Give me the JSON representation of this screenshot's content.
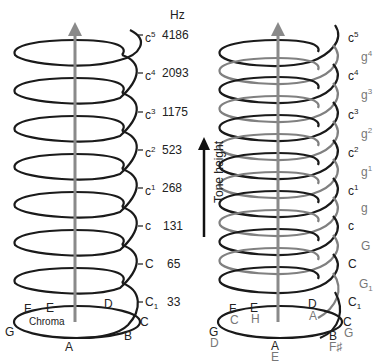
{
  "header": {
    "hz_label": "Hz"
  },
  "left_helix": {
    "notes": [
      {
        "base": "c",
        "sup": "5",
        "hz": "4186"
      },
      {
        "base": "c",
        "sup": "4",
        "hz": "2093"
      },
      {
        "base": "c",
        "sup": "3",
        "hz": "1175"
      },
      {
        "base": "c",
        "sup": "2",
        "hz": "523"
      },
      {
        "base": "c",
        "sup": "1",
        "hz": "268"
      },
      {
        "base": "c",
        "sup": "",
        "hz": "131"
      },
      {
        "base": "C",
        "sup": "",
        "hz": "65"
      },
      {
        "base": "C",
        "sub": "1",
        "hz": "33"
      }
    ],
    "chroma_label": "Chroma",
    "chroma_notes": {
      "G": "G",
      "F": "F",
      "E": "E",
      "D": "D",
      "C": "C",
      "B": "B",
      "A": "A"
    }
  },
  "axis": {
    "tone_height_label": "Tone height"
  },
  "right_helix": {
    "notes": [
      {
        "base": "c",
        "sup": "5",
        "color": "dark"
      },
      {
        "base": "g",
        "sup": "4",
        "color": "gray"
      },
      {
        "base": "c",
        "sup": "4",
        "color": "dark"
      },
      {
        "base": "g",
        "sup": "3",
        "color": "gray"
      },
      {
        "base": "c",
        "sup": "3",
        "color": "dark"
      },
      {
        "base": "g",
        "sup": "2",
        "color": "gray"
      },
      {
        "base": "c",
        "sup": "2",
        "color": "dark"
      },
      {
        "base": "g",
        "sup": "1",
        "color": "gray"
      },
      {
        "base": "c",
        "sup": "1",
        "color": "dark"
      },
      {
        "base": "g",
        "sup": "",
        "color": "gray"
      },
      {
        "base": "c",
        "sup": "",
        "color": "dark"
      },
      {
        "base": "G",
        "sup": "",
        "color": "gray"
      },
      {
        "base": "C",
        "sup": "",
        "color": "dark"
      },
      {
        "base": "G",
        "sub": "1",
        "color": "gray"
      },
      {
        "base": "C",
        "sub": "1",
        "color": "dark"
      }
    ],
    "chroma_notes_dark": {
      "F": "F",
      "E": "E",
      "D": "D",
      "C": "C",
      "G": "G",
      "B": "B",
      "A": "A"
    },
    "chroma_notes_gray": {
      "C": "C",
      "H": "H",
      "A": "A",
      "G": "G",
      "D": "D",
      "Fsharp": "F♯",
      "E": "E"
    }
  },
  "colors": {
    "dark": "#1a1a1a",
    "gray": "#808080",
    "axis": "#8a8a8a"
  }
}
